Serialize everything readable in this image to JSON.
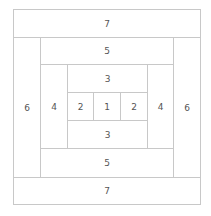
{
  "blocks": [
    {
      "label": "7",
      "x": 13,
      "y": 9,
      "w": 188,
      "h": 29
    },
    {
      "label": "6",
      "x": 13,
      "y": 37,
      "w": 28,
      "h": 141
    },
    {
      "label": "5",
      "x": 40,
      "y": 37,
      "w": 134,
      "h": 28
    },
    {
      "label": "4",
      "x": 40,
      "y": 64,
      "w": 28,
      "h": 85
    },
    {
      "label": "3",
      "x": 67,
      "y": 64,
      "w": 81,
      "h": 29
    },
    {
      "label": "2",
      "x": 67,
      "y": 92,
      "w": 27,
      "h": 29
    },
    {
      "label": "1",
      "x": 93,
      "y": 92,
      "w": 28,
      "h": 29
    },
    {
      "label": "2",
      "x": 120,
      "y": 92,
      "w": 28,
      "h": 29
    },
    {
      "label": "3",
      "x": 67,
      "y": 120,
      "w": 81,
      "h": 29
    },
    {
      "label": "4",
      "x": 147,
      "y": 64,
      "w": 27,
      "h": 85
    },
    {
      "label": "5",
      "x": 40,
      "y": 148,
      "w": 134,
      "h": 30
    },
    {
      "label": "6",
      "x": 173,
      "y": 37,
      "w": 28,
      "h": 141
    },
    {
      "label": "7",
      "x": 13,
      "y": 177,
      "w": 188,
      "h": 28
    }
  ]
}
